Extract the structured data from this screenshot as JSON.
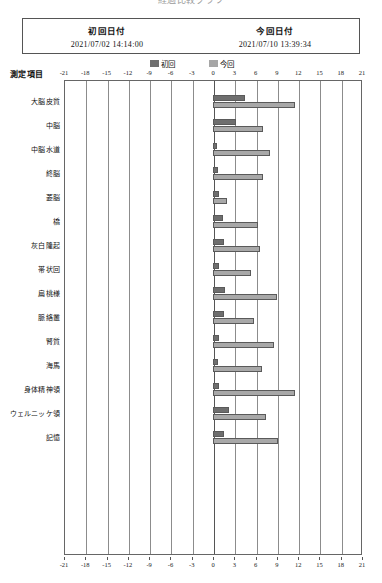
{
  "title": {
    "clipped_text": "経過比較グラフ"
  },
  "header": {
    "first_date_label": "初回日付",
    "first_date_value": "2021/07/02  14:14:00",
    "current_date_label": "今回日付",
    "current_date_value": "2021/07/10  13:39:34"
  },
  "legend": {
    "items": [
      {
        "label": "初回",
        "color": "#6f6f6f",
        "key": "first"
      },
      {
        "label": "今回",
        "color": "#a6a6a6",
        "key": "second"
      }
    ]
  },
  "axis_title": "測定項目",
  "chart_data": {
    "type": "bar",
    "orientation": "horizontal",
    "title": "経過比較グラフ",
    "xlabel": "",
    "ylabel": "測定項目",
    "xlim": [
      -21,
      21
    ],
    "xticks": [
      -21,
      -18,
      -15,
      -12,
      -9,
      -6,
      -3,
      0,
      3,
      6,
      9,
      12,
      15,
      18,
      21
    ],
    "grid": true,
    "legend_position": "top",
    "categories": [
      "大脳皮質",
      "中脳",
      "中脳水道",
      "終脳",
      "菱脳",
      "橋",
      "灰白隆起",
      "帯状回",
      "扁桃様",
      "脈絡叢",
      "腎質",
      "海馬",
      "身体精神領",
      "ウェルニッケ領",
      "記憶"
    ],
    "series": [
      {
        "name": "初回",
        "color": "#6e6e6e",
        "values": [
          4.5,
          3.3,
          0.6,
          0.7,
          0.8,
          1.4,
          1.5,
          0.9,
          1.7,
          1.6,
          0.8,
          0.7,
          0.8,
          2.2,
          1.6
        ]
      },
      {
        "name": "今回",
        "color": "#a8a8a8",
        "values": [
          11.5,
          7.0,
          8.0,
          7.1,
          2.0,
          6.3,
          6.6,
          5.4,
          9.0,
          5.8,
          8.6,
          6.9,
          11.6,
          7.4,
          9.1
        ]
      }
    ]
  }
}
